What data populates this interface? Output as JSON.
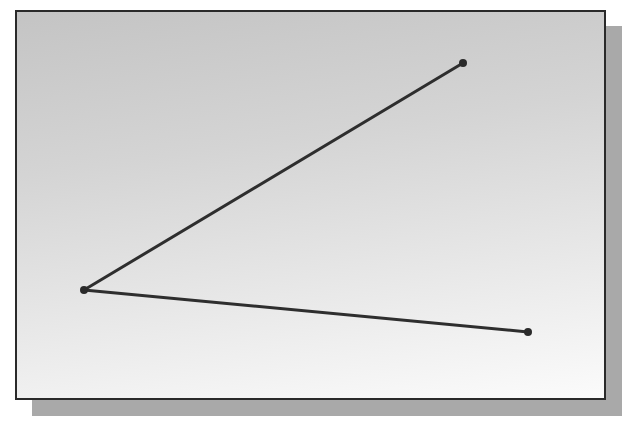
{
  "canvas": {
    "frame": {
      "x": 15,
      "y": 10,
      "width": 591,
      "height": 390
    },
    "shadow_color": "#a9a9a9",
    "line_color": "#2e2e2e"
  },
  "drawing": {
    "vertex": {
      "x": 84,
      "y": 290
    },
    "endpoints": [
      {
        "name": "upper-endpoint",
        "x": 463,
        "y": 63
      },
      {
        "name": "lower-endpoint",
        "x": 528,
        "y": 332
      }
    ],
    "segments": [
      {
        "from": "vertex",
        "to": "upper-endpoint"
      },
      {
        "from": "vertex",
        "to": "lower-endpoint"
      }
    ]
  }
}
